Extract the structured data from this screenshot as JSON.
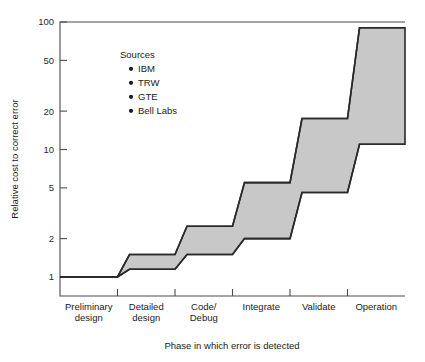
{
  "chart_data": {
    "type": "area",
    "title": "",
    "xlabel": "Phase in which error is detected",
    "ylabel": "Relative cost to correct error",
    "yscale": "log",
    "ylim": [
      1,
      100
    ],
    "yticks": [
      1,
      2,
      5,
      10,
      20,
      50,
      100
    ],
    "ytick_labels": [
      "1",
      "2",
      "5",
      "10",
      "20",
      "50",
      "100"
    ],
    "grid": false,
    "categories": [
      "Preliminary design",
      "Detailed design",
      "Code/ Debug",
      "Integrate",
      "Validate",
      "Operation"
    ],
    "category_lines": [
      [
        "Preliminary",
        "design"
      ],
      [
        "Detailed",
        "design"
      ],
      [
        "Code/",
        "Debug"
      ],
      [
        "Integrate",
        ""
      ],
      [
        "Validate",
        ""
      ],
      [
        "Operation",
        ""
      ]
    ],
    "series": [
      {
        "name": "Upper bound of relative cost",
        "values": [
          1.0,
          1.5,
          2.5,
          5.5,
          17.5,
          90
        ]
      },
      {
        "name": "Lower bound of relative cost",
        "values": [
          1.0,
          1.15,
          1.5,
          2.0,
          4.6,
          11
        ]
      }
    ],
    "band_fill_color": "#c8c8c8",
    "band_stroke_color": "#2a2a2a",
    "legend": {
      "position": "inside-upper-left",
      "title": "Sources",
      "entries": [
        "IBM",
        "TRW",
        "GTE",
        "Bell Labs"
      ]
    }
  }
}
